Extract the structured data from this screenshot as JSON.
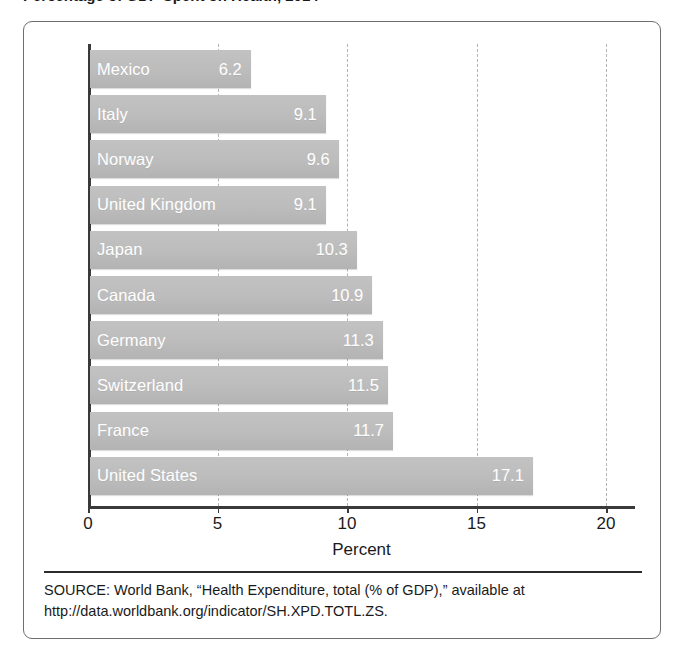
{
  "figure": {
    "title_clipped": "Percentage of GDP Spent on Health, 2014",
    "frame_style": "rounded-rectangle-border"
  },
  "chart_data": {
    "type": "bar",
    "orientation": "horizontal",
    "title": "",
    "xlabel": "Percent",
    "ylabel": "",
    "xlim": [
      0,
      20
    ],
    "xticks": [
      "0",
      "5",
      "10",
      "15",
      "20"
    ],
    "xtick_values": [
      0,
      5,
      10,
      15,
      20
    ],
    "grid": "vertical-dashed",
    "legend": "none",
    "bar_color": "#bdbdbd",
    "label_color": "#ffffff",
    "categories": [
      "Mexico",
      "Italy",
      "Norway",
      "United Kingdom",
      "Japan",
      "Canada",
      "Germany",
      "Switzerland",
      "France",
      "United States"
    ],
    "values": [
      6.2,
      9.1,
      9.6,
      9.1,
      10.3,
      10.9,
      11.3,
      11.5,
      11.7,
      17.1
    ],
    "bars": [
      {
        "label": "Mexico",
        "value": 6.2,
        "value_label": "6.2"
      },
      {
        "label": "Italy",
        "value": 9.1,
        "value_label": "9.1"
      },
      {
        "label": "Norway",
        "value": 9.6,
        "value_label": "9.6"
      },
      {
        "label": "United Kingdom",
        "value": 9.1,
        "value_label": "9.1"
      },
      {
        "label": "Japan",
        "value": 10.3,
        "value_label": "10.3"
      },
      {
        "label": "Canada",
        "value": 10.9,
        "value_label": "10.9"
      },
      {
        "label": "Germany",
        "value": 11.3,
        "value_label": "11.3"
      },
      {
        "label": "Switzerland",
        "value": 11.5,
        "value_label": "11.5"
      },
      {
        "label": "France",
        "value": 11.7,
        "value_label": "11.7"
      },
      {
        "label": "United States",
        "value": 17.1,
        "value_label": "17.1"
      }
    ]
  },
  "source": {
    "line1": "SOURCE: World Bank, “Health Expenditure, total (% of GDP),” available at",
    "line2": "http://data.worldbank.org/indicator/SH.XPD.TOTL.ZS."
  }
}
